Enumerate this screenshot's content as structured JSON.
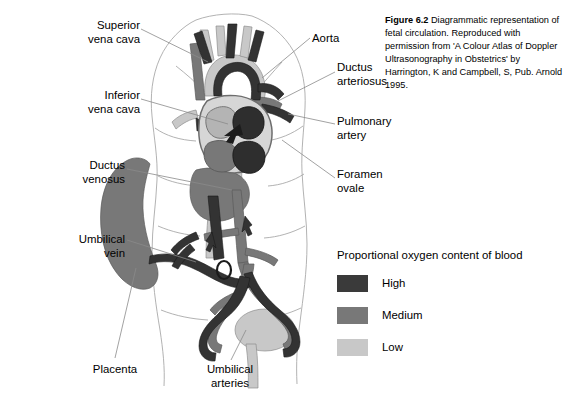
{
  "figure": {
    "caption_label": "Figure 6.2",
    "caption_text": " Diagrammatic representation of fetal circulation. Reproduced with permission from 'A Colour Atlas of Doppler Ultrasonography in Obstetrics' by Harrington, K and Campbell, S, Pub. Arnold 1995."
  },
  "labels": {
    "superior_vena_cava": "Superior\nvena cava",
    "inferior_vena_cava": "Inferior\nvena cava",
    "ductus_venosus": "Ductus\nvenosus",
    "umbilical_vein": "Umbilical\nvein",
    "placenta": "Placenta",
    "umbilical_arteries": "Umbilical\narteries",
    "aorta": "Aorta",
    "ductus_arteriosus": "Ductus\narteriosus",
    "pulmonary_artery": "Pulmonary\nartery",
    "foramen_ovale": "Foramen\novale"
  },
  "legend": {
    "title": "Proportional oxygen content of blood",
    "items": [
      {
        "label": "High",
        "color": "#3a3a3a"
      },
      {
        "label": "Medium",
        "color": "#787878"
      },
      {
        "label": "Low",
        "color": "#c8c8c8"
      }
    ]
  },
  "colors": {
    "background": "#ffffff",
    "high_oxygen": "#3a3a3a",
    "medium_oxygen": "#787878",
    "low_oxygen": "#c8c8c8",
    "body_outline": "#a8a8a8",
    "leader_line": "#8a8a8a",
    "text": "#000000"
  }
}
